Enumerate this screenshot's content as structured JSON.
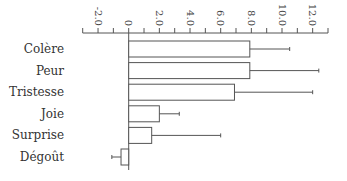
{
  "chart_data": {
    "type": "bar",
    "orientation": "horizontal",
    "title": "",
    "xlabel": "",
    "ylabel": "",
    "categories": [
      "Colère",
      "Peur",
      "Tristesse",
      "Joie",
      "Surprise",
      "Dégoût"
    ],
    "values": [
      7.9,
      7.9,
      6.9,
      2.0,
      1.5,
      -0.5
    ],
    "error_upper": [
      10.5,
      12.4,
      12.0,
      3.3,
      6.0,
      -1.1
    ],
    "error_bars": [
      2.6,
      4.5,
      5.1,
      1.3,
      4.5,
      0.6
    ],
    "xlim": [
      -3.0,
      13.0
    ],
    "xticks_major": [
      -2.0,
      0,
      2.0,
      4.0,
      6.0,
      8.0,
      10.0,
      12.0
    ],
    "xtick_labels": [
      "-2.0",
      "0",
      "2.0",
      "4.0",
      "6.0",
      "8.0",
      "10.0",
      "12.0"
    ],
    "xticks_minor": [
      -3,
      -1,
      1,
      3,
      5,
      7,
      9,
      11,
      13
    ],
    "axis_position": "top",
    "tick_label_rotation": 90,
    "grid": false,
    "legend": null,
    "colors": {
      "bar_fill": "#ffffff",
      "bar_stroke": "#555555",
      "axis": "#555555",
      "text": "#333333"
    }
  }
}
